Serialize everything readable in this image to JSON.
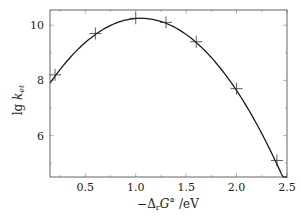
{
  "chart_data": {
    "type": "scatter",
    "title": "",
    "xlabel": "−Δ_r G° / eV",
    "ylabel": "lg k_et",
    "xlim": [
      0.15,
      2.5
    ],
    "ylim": [
      4.5,
      10.55
    ],
    "grid": false,
    "legend": null,
    "x_ticks": [
      0.5,
      1.0,
      1.5,
      2.0,
      2.5
    ],
    "x_tick_labels": [
      "0.5",
      "1.0",
      "1.5",
      "2.0",
      "2.5"
    ],
    "y_ticks": [
      6,
      8,
      10
    ],
    "y_tick_labels": [
      "6",
      "8",
      "10"
    ],
    "series": [
      {
        "name": "measured",
        "marker": "+",
        "x": [
          0.2,
          0.6,
          1.0,
          1.3,
          1.6,
          2.0,
          2.4
        ],
        "y": [
          8.2,
          9.7,
          10.25,
          10.1,
          9.4,
          7.7,
          5.1
        ]
      },
      {
        "name": "fit",
        "style": "line",
        "model": "parabola",
        "vertex_x": 1.05,
        "vertex_y": 10.25,
        "curvature": 2.9,
        "x_range": [
          0.15,
          2.5
        ]
      }
    ]
  },
  "labels": {
    "xlabel_prefix": "−Δ",
    "xlabel_sub": "r",
    "xlabel_main": "G°",
    "xlabel_unit": " /eV",
    "ylabel_main": "lg ",
    "ylabel_k": "k",
    "ylabel_sub": "et"
  }
}
